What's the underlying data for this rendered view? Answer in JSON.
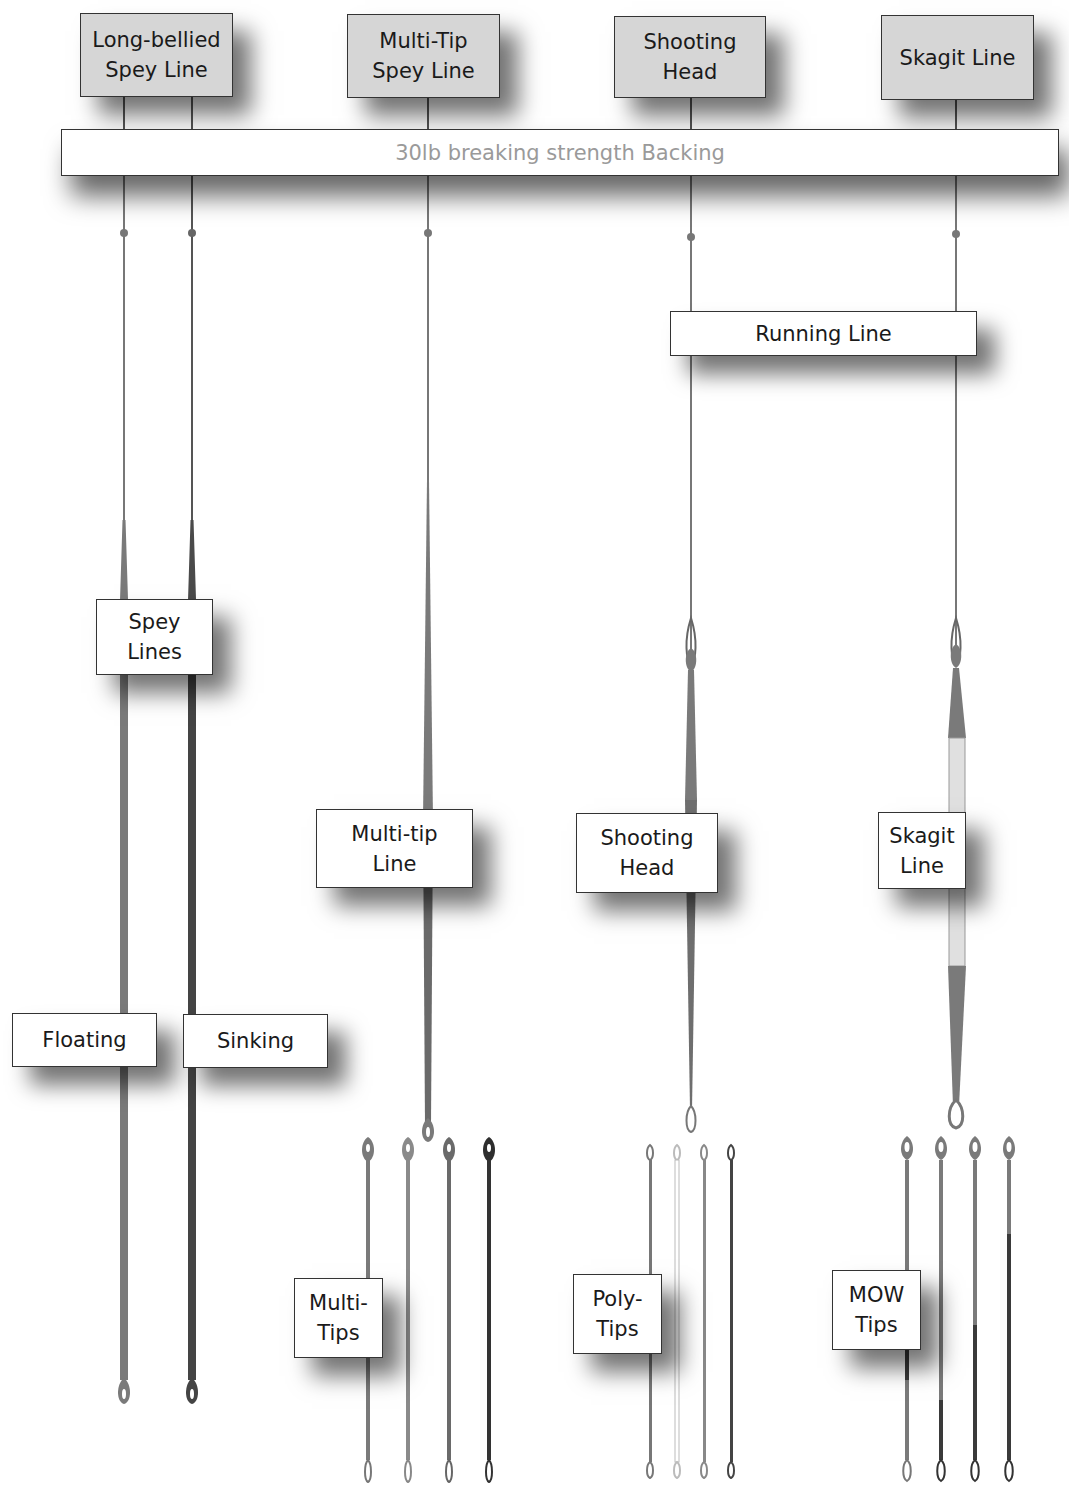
{
  "header_boxes": [
    {
      "id": "long-bellied",
      "lines": [
        "Long-bellied",
        "Spey Line"
      ]
    },
    {
      "id": "multi-tip",
      "lines": [
        "Multi-Tip",
        "Spey Line"
      ]
    },
    {
      "id": "shooting-head",
      "lines": [
        "Shooting",
        "Head"
      ]
    },
    {
      "id": "skagit",
      "lines": [
        "Skagit Line"
      ]
    }
  ],
  "backing": {
    "label": "30lb breaking strength Backing"
  },
  "running_line": {
    "label": "Running Line"
  },
  "labels": {
    "spey_lines": [
      "Spey",
      "Lines"
    ],
    "floating": [
      "Floating"
    ],
    "sinking": [
      "Sinking"
    ],
    "multi_tip_line": [
      "Multi-tip",
      "Line"
    ],
    "shooting_head": [
      "Shooting",
      "Head"
    ],
    "skagit_line": [
      "Skagit",
      "Line"
    ],
    "multi_tips": [
      "Multi-",
      "Tips"
    ],
    "poly_tips": [
      "Poly-",
      "Tips"
    ],
    "mow_tips": [
      "MOW",
      "Tips"
    ]
  },
  "colors": {
    "line_mid": "#7a7a7a",
    "line_dark": "#3a3a3a",
    "line_light": "#d8d8d8",
    "header_fill": "#d6d6d6",
    "backing_text": "#9a9a9a",
    "border": "#333333"
  }
}
